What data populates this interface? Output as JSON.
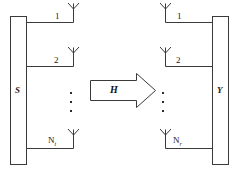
{
  "diagram": {
    "transmitter": {
      "block_label": "S",
      "antennas": [
        {
          "label": "1"
        },
        {
          "label": "2"
        },
        {
          "label": "N",
          "sub": "t"
        }
      ],
      "ellipsis": "vertical-dots"
    },
    "channel": {
      "label": "H",
      "shape": "block-arrow-right"
    },
    "receiver": {
      "block_label": "Y",
      "antennas": [
        {
          "label": "1"
        },
        {
          "label": "2"
        },
        {
          "label": "N",
          "sub": "r"
        }
      ],
      "ellipsis": "vertical-dots"
    },
    "colors": {
      "stroke": "#3a3a3a",
      "text": "#1a1a1a",
      "background": "#ffffff"
    }
  }
}
